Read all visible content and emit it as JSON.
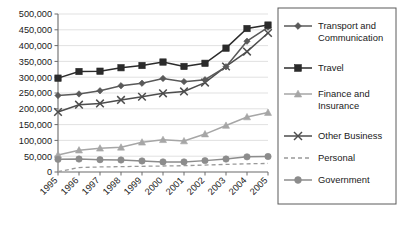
{
  "chart_data": {
    "type": "line",
    "title": "",
    "subtitle": "",
    "xlabel": "",
    "ylabel": "",
    "grid": true,
    "legend_position": "right",
    "xlim": [
      1995,
      2005
    ],
    "ylim": [
      0,
      500000
    ],
    "x": [
      1995,
      1996,
      1997,
      1998,
      1999,
      2000,
      2001,
      2002,
      2003,
      2004,
      2005
    ],
    "categories": [
      "1995",
      "1996",
      "1997",
      "1998",
      "1999",
      "2000",
      "2001",
      "2002",
      "2003",
      "2004",
      "2005"
    ],
    "ytick_labels": [
      "0",
      "50,000",
      "100,000",
      "150,000",
      "200,000",
      "250,000",
      "300,000",
      "350,000",
      "400,000",
      "450,000",
      "500,000"
    ],
    "ytick_values": [
      0,
      50000,
      100000,
      150000,
      200000,
      250000,
      300000,
      350000,
      400000,
      450000,
      500000
    ],
    "series": [
      {
        "name": "Transport and Communication",
        "marker": "diamond",
        "color": "#595959",
        "dash": "none",
        "values": [
          242000,
          247000,
          257000,
          273000,
          281000,
          296000,
          286000,
          292000,
          333000,
          414000,
          458000
        ]
      },
      {
        "name": "Travel",
        "marker": "square",
        "color": "#2b2b2b",
        "dash": "none",
        "values": [
          297000,
          318000,
          319000,
          330000,
          337000,
          348000,
          334000,
          344000,
          392000,
          454000,
          465000
        ]
      },
      {
        "name": "Finance and Insurance",
        "marker": "triangle",
        "color": "#a6a6a6",
        "dash": "none",
        "values": [
          54000,
          69000,
          75000,
          78000,
          94000,
          102000,
          98000,
          120000,
          147000,
          174000,
          188000
        ]
      },
      {
        "name": "Other Business",
        "marker": "cross",
        "color": "#4d4d4d",
        "dash": "none",
        "values": [
          190000,
          213000,
          217000,
          228000,
          238000,
          249000,
          255000,
          283000,
          334000,
          381000,
          440000
        ]
      },
      {
        "name": "Personal",
        "marker": "none",
        "color": "#999999",
        "dash": "dashed",
        "values": [
          1000,
          14000,
          16000,
          17000,
          18000,
          19000,
          20000,
          22000,
          24000,
          26000,
          27000
        ]
      },
      {
        "name": "Government",
        "marker": "circle",
        "color": "#8c8c8c",
        "dash": "none",
        "values": [
          40000,
          41000,
          39000,
          38000,
          35000,
          32000,
          32000,
          36000,
          41000,
          48000,
          49000
        ]
      }
    ]
  },
  "legend": {
    "entries": [
      "Transport and Communication",
      "Travel",
      "Finance and Insurance",
      "Other Business",
      "Personal",
      "Government"
    ],
    "entries_wrapped": [
      [
        "Transport and",
        "Communication"
      ],
      [
        "Travel"
      ],
      [
        "Finance and",
        "Insurance"
      ],
      [
        "Other Business"
      ],
      [
        "Personal"
      ],
      [
        "Government"
      ]
    ]
  },
  "colors": {
    "transport": "#595959",
    "travel": "#2b2b2b",
    "finance": "#a6a6a6",
    "other_business": "#4d4d4d",
    "personal": "#999999",
    "government": "#8c8c8c",
    "grid": "#d9d9d9",
    "axis": "#6b6b6b",
    "background": "#ffffff"
  }
}
